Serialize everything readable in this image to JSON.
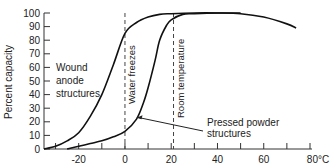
{
  "chart_data": {
    "type": "line",
    "title": "",
    "xlabel": "",
    "x_unit_label": "°C",
    "ylabel": "Percent capacity",
    "xlim": [
      -35,
      80
    ],
    "ylim": [
      0,
      100
    ],
    "grid": false,
    "legend": "none (curves labeled directly)",
    "x_ticks": [
      -30,
      -20,
      -10,
      0,
      10,
      20,
      30,
      40,
      50,
      60,
      70,
      80
    ],
    "x_tick_labels": [
      "-20",
      "0",
      "20",
      "40",
      "60",
      "80°C"
    ],
    "x_tick_label_values": [
      -20,
      0,
      20,
      40,
      60,
      80
    ],
    "y_ticks": [
      0,
      10,
      20,
      30,
      40,
      50,
      60,
      70,
      80,
      90,
      100
    ],
    "y_tick_labels": [
      "0",
      "10",
      "20",
      "30",
      "40",
      "50",
      "60",
      "70",
      "80",
      "90",
      "100"
    ],
    "series": [
      {
        "name": "Wound anode structures",
        "x": [
          -35,
          -30,
          -25,
          -20,
          -15,
          -10,
          -5,
          0,
          5,
          10,
          15,
          20,
          30,
          40,
          50,
          60,
          70,
          74
        ],
        "y": [
          0,
          2,
          6,
          12,
          24,
          40,
          62,
          85,
          93,
          97,
          99,
          99.5,
          100,
          100,
          99.5,
          97,
          92,
          89
        ]
      },
      {
        "name": "Pressed powder structures",
        "x": [
          -25,
          -20,
          -15,
          -10,
          -5,
          0,
          5,
          8,
          10,
          13,
          15,
          18,
          20,
          25,
          30,
          40,
          50
        ],
        "y": [
          0,
          2,
          4,
          6,
          9,
          13,
          22,
          34,
          45,
          65,
          80,
          91,
          95,
          99,
          99.5,
          100,
          100
        ]
      }
    ],
    "reference_lines": [
      {
        "label": "Water freezes",
        "x": 0,
        "style": "dashed vertical"
      },
      {
        "label": "Room temperature",
        "x": 21,
        "style": "dashed vertical"
      }
    ],
    "annotations": [
      {
        "text": [
          "Wound",
          "anode",
          "structures"
        ],
        "near_series": "Wound anode structures"
      },
      {
        "text": [
          "Pressed powder",
          "structures"
        ],
        "arrow_to": {
          "x": 5,
          "y": 23
        }
      }
    ]
  }
}
